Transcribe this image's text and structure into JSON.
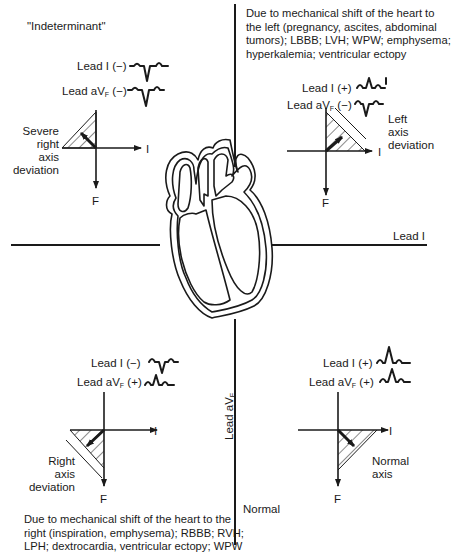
{
  "figure": {
    "type": "ECG electrical axis quadrant diagram",
    "horizontal_axis_label": "Lead I",
    "vertical_axis_label": "Lead aV",
    "vertical_axis_label_sub": "F"
  },
  "quadrants": {
    "top_left": {
      "title": "\"Indeterminant\"",
      "lead_i": {
        "label": "Lead I (−)",
        "polarity": "negative"
      },
      "lead_avf": {
        "label_main": "Lead aV",
        "label_sub": "F",
        "label_tail": " (−)",
        "polarity": "negative"
      },
      "axis_label": [
        "Severe",
        "right",
        "axis",
        "deviation"
      ],
      "axis_x_label": "I",
      "axis_y_label": "F"
    },
    "top_right": {
      "description": [
        "Due to mechanical shift of the heart to",
        "the left (pregnancy, ascites, abdominal",
        "tumors); LBBB; LVH; WPW; emphysema;",
        "hyperkalemia; ventricular ectopy"
      ],
      "lead_i": {
        "label": "Lead I (+)",
        "polarity": "positive"
      },
      "lead_avf": {
        "label_main": "Lead aV",
        "label_sub": "F",
        "label_tail": " (−)",
        "polarity": "negative"
      },
      "axis_label": [
        "Left",
        "axis",
        "deviation"
      ],
      "axis_x_label": "I",
      "axis_y_label": "F"
    },
    "bottom_left": {
      "lead_i": {
        "label": "Lead I (−)",
        "polarity": "negative"
      },
      "lead_avf": {
        "label_main": "Lead aV",
        "label_sub": "F",
        "label_tail": " (+)",
        "polarity": "positive"
      },
      "axis_label": [
        "Right",
        "axis",
        "deviation"
      ],
      "axis_x_label": "I",
      "axis_y_label": "F",
      "description": [
        "Due to mechanical shift of the heart to the",
        "right (inspiration, emphysema); RBBB; RVH;",
        "LPH; dextrocardia, ventricular ectopy; WPW"
      ]
    },
    "bottom_right": {
      "title": "Normal",
      "lead_i": {
        "label": "Lead I (+)",
        "polarity": "positive"
      },
      "lead_avf": {
        "label_main": "Lead aV",
        "label_sub": "F",
        "label_tail": " (+)",
        "polarity": "positive"
      },
      "axis_label": [
        "Normal",
        "axis"
      ],
      "axis_x_label": "I",
      "axis_y_label": "F"
    }
  },
  "colors": {
    "ink": "#1a1a1a",
    "background": "#ffffff"
  }
}
